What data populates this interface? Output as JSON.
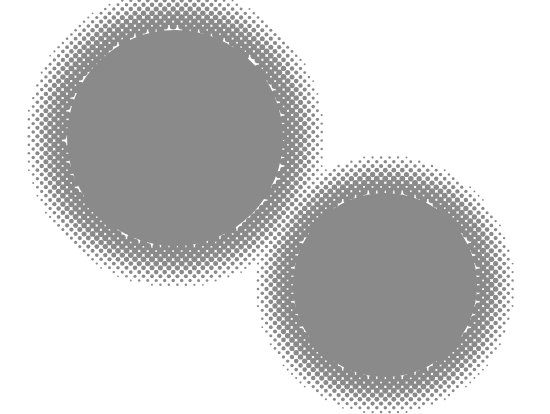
{
  "image": {
    "description": "Two overlapping gray halftone circles on a white background",
    "background_color": "#ffffff",
    "dot_color": "#8a8a8a",
    "dot_pitch": 6,
    "circles": [
      {
        "name": "large-circle",
        "cx": 175,
        "cy": 138,
        "solid_radius": 108,
        "fade_radius": 152
      },
      {
        "name": "small-circle",
        "cx": 385,
        "cy": 285,
        "solid_radius": 92,
        "fade_radius": 132
      }
    ]
  }
}
